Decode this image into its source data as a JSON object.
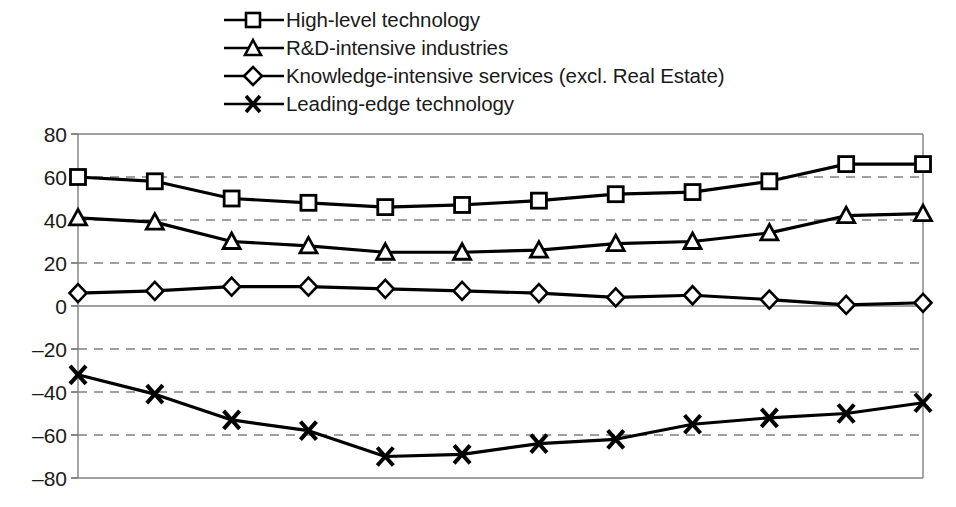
{
  "chart_data": {
    "type": "line",
    "title": "",
    "xlabel": "",
    "ylabel": "",
    "ylim": [
      -80,
      80
    ],
    "ytick_step": 20,
    "yticks": [
      80,
      60,
      40,
      20,
      0,
      -20,
      -40,
      -60,
      -80
    ],
    "ytick_labels": [
      "80",
      "60",
      "40",
      "20",
      "0",
      "–20",
      "–40",
      "–60",
      "–80"
    ],
    "grid": "horizontal-dashed",
    "grid_zero_solid": true,
    "xticks_visible": false,
    "legend_position": "top",
    "n_points": 12,
    "x": [
      1,
      2,
      3,
      4,
      5,
      6,
      7,
      8,
      9,
      10,
      11,
      12
    ],
    "series": [
      {
        "name": "High-level technology",
        "marker": "square",
        "color": "#000000",
        "values": [
          60,
          58,
          50,
          48,
          46,
          47,
          49,
          52,
          53,
          58,
          66,
          66
        ]
      },
      {
        "name": "R&D-intensive industries",
        "marker": "triangle",
        "color": "#000000",
        "values": [
          41,
          39,
          30,
          28,
          25,
          25,
          26,
          29,
          30,
          34,
          42,
          43
        ]
      },
      {
        "name": "Knowledge-intensive services (excl. Real Estate)",
        "marker": "diamond",
        "color": "#000000",
        "values": [
          6,
          7,
          9,
          9,
          8,
          7,
          6,
          4,
          5,
          3,
          0.5,
          1.5
        ]
      },
      {
        "name": "Leading-edge technology",
        "marker": "cross",
        "color": "#000000",
        "values": [
          -32,
          -41,
          -53,
          -58,
          -70,
          -69,
          -64,
          -62,
          -55,
          -52,
          -50,
          -45
        ]
      }
    ]
  },
  "legend": {
    "items": [
      {
        "label": "High-level technology",
        "marker": "square"
      },
      {
        "label": "R&D-intensive industries",
        "marker": "triangle"
      },
      {
        "label": "Knowledge-intensive services (excl. Real Estate)",
        "marker": "diamond"
      },
      {
        "label": "Leading-edge technology",
        "marker": "cross"
      }
    ]
  }
}
